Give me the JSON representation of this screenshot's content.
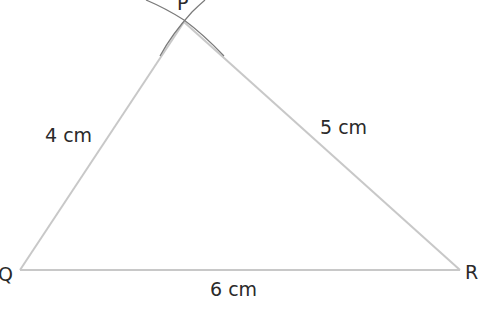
{
  "diagram": {
    "type": "triangle-construction",
    "vertices": {
      "P": "P",
      "Q": "Q",
      "R": "R"
    },
    "sides": {
      "PQ": "4 cm",
      "PR": "5 cm",
      "QR": "6 cm"
    },
    "colors": {
      "line": "#c8c8c8",
      "arc": "#7a7a7a",
      "text": "#2a2a2a"
    }
  }
}
